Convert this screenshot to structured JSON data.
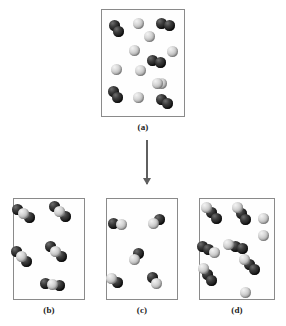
{
  "figure": {
    "type": "particulate-reaction-diagram",
    "atom_colors": {
      "dark": "#191919",
      "light": "#d6d6d6"
    },
    "box_border_color": "#8a8a8a",
    "arrow_color": "#5f5f5f"
  },
  "arrow": {
    "name": "reaction-arrow",
    "direction": "down"
  },
  "panels": [
    {
      "id": "a",
      "caption": "(a)",
      "box": {
        "x": 101,
        "y": 9,
        "w": 84,
        "h": 108
      },
      "contents_summary": {
        "dark_diatomic_molecules": 5,
        "light_single_atoms": 9
      },
      "molecules": [
        {
          "name": "dark-diatomic",
          "x": 9,
          "y": 13,
          "angle": 62,
          "atoms": [
            "dark",
            "dark"
          ]
        },
        {
          "name": "dark-diatomic",
          "x": 58,
          "y": 9,
          "angle": 10,
          "atoms": [
            "dark",
            "dark"
          ]
        },
        {
          "name": "dark-diatomic",
          "x": 49,
          "y": 46,
          "angle": 12,
          "atoms": [
            "dark",
            "dark"
          ]
        },
        {
          "name": "dark-diatomic",
          "x": 8,
          "y": 79,
          "angle": 58,
          "atoms": [
            "dark",
            "dark"
          ]
        },
        {
          "name": "dark-diatomic",
          "x": 57,
          "y": 86,
          "angle": 28,
          "atoms": [
            "dark",
            "dark"
          ]
        }
      ],
      "single_atoms": [
        {
          "name": "light-atom",
          "x": 31,
          "y": 8,
          "type": "light"
        },
        {
          "name": "light-atom",
          "x": 42,
          "y": 21,
          "type": "light"
        },
        {
          "name": "light-atom",
          "x": 27,
          "y": 35,
          "type": "light"
        },
        {
          "name": "light-atom",
          "x": 65,
          "y": 36,
          "type": "light"
        },
        {
          "name": "light-atom",
          "x": 9,
          "y": 54,
          "type": "light"
        },
        {
          "name": "light-atom",
          "x": 33,
          "y": 55,
          "type": "light"
        },
        {
          "name": "light-atom",
          "x": 54,
          "y": 68,
          "type": "light"
        },
        {
          "name": "light-atom",
          "x": 31,
          "y": 82,
          "type": "light"
        },
        {
          "name": "light-atom",
          "x": 50,
          "y": 68,
          "type": "light"
        }
      ]
    },
    {
      "id": "b",
      "caption": "(b)",
      "box": {
        "x": 13,
        "y": 198,
        "w": 72,
        "h": 102
      },
      "contents_summary": {
        "triatomic_molecules": 5,
        "triatomic_composition": "dark-light-dark"
      },
      "molecules": [
        {
          "name": "triatomic-dark-light-dark",
          "x": 4,
          "y": 9,
          "angle": 38,
          "atoms": [
            "dark",
            "light",
            "dark"
          ]
        },
        {
          "name": "triatomic-dark-light-dark",
          "x": 40,
          "y": 7,
          "angle": 40,
          "atoms": [
            "dark",
            "light",
            "dark"
          ]
        },
        {
          "name": "triatomic-dark-light-dark",
          "x": 2,
          "y": 52,
          "angle": 42,
          "atoms": [
            "dark",
            "light",
            "dark"
          ]
        },
        {
          "name": "triatomic-dark-light-dark",
          "x": 36,
          "y": 47,
          "angle": 40,
          "atoms": [
            "dark",
            "light",
            "dark"
          ]
        },
        {
          "name": "triatomic-dark-light-dark",
          "x": 33,
          "y": 80,
          "angle": 10,
          "atoms": [
            "dark",
            "light",
            "dark"
          ]
        }
      ],
      "single_atoms": []
    },
    {
      "id": "c",
      "caption": "(c)",
      "box": {
        "x": 106,
        "y": 198,
        "w": 72,
        "h": 102
      },
      "contents_summary": {
        "diatomic_molecules": 5,
        "diatomic_composition": "dark-light"
      },
      "molecules": [
        {
          "name": "diatomic-dark-light",
          "x": 5,
          "y": 19,
          "angle": 8,
          "atoms": [
            "dark",
            "light"
          ]
        },
        {
          "name": "diatomic-dark-light",
          "x": 44,
          "y": 17,
          "angle": 140,
          "atoms": [
            "dark",
            "light"
          ]
        },
        {
          "name": "diatomic-dark-light",
          "x": 24,
          "y": 52,
          "angle": 118,
          "atoms": [
            "dark",
            "light"
          ]
        },
        {
          "name": "diatomic-dark-light",
          "x": 2,
          "y": 76,
          "angle": 32,
          "atoms": [
            "light",
            "dark"
          ]
        },
        {
          "name": "diatomic-dark-light",
          "x": 42,
          "y": 76,
          "angle": 48,
          "atoms": [
            "dark",
            "light"
          ]
        }
      ],
      "single_atoms": []
    },
    {
      "id": "d",
      "caption": "(d)",
      "box": {
        "x": 199,
        "y": 198,
        "w": 76,
        "h": 102
      },
      "contents_summary": {
        "triatomic_molecules": 6,
        "triatomic_composition": "light-dark-dark",
        "light_single_atoms": 3
      },
      "molecules": [
        {
          "name": "triatomic-light-dark-dark",
          "x": 6,
          "y": 8,
          "angle": 50,
          "atoms": [
            "light",
            "dark",
            "dark"
          ]
        },
        {
          "name": "triatomic-light-dark-dark",
          "x": 36,
          "y": 9,
          "angle": 55,
          "atoms": [
            "light",
            "dark",
            "dark"
          ]
        },
        {
          "name": "triatomic-light-dark-dark",
          "x": 3,
          "y": 45,
          "angle": 28,
          "atoms": [
            "dark",
            "dark",
            "light"
          ]
        },
        {
          "name": "triatomic-light-dark-dark",
          "x": 44,
          "y": 60,
          "angle": 48,
          "atoms": [
            "light",
            "dark",
            "dark"
          ]
        },
        {
          "name": "triatomic-light-dark-dark",
          "x": 2,
          "y": 70,
          "angle": 52,
          "atoms": [
            "light",
            "dark",
            "dark"
          ]
        },
        {
          "name": "triatomic-light-dark-dark",
          "x": 30,
          "y": 42,
          "angle": 18,
          "atoms": [
            "light",
            "dark",
            "dark"
          ]
        }
      ],
      "single_atoms": [
        {
          "name": "light-atom",
          "x": 58,
          "y": 14,
          "type": "light"
        },
        {
          "name": "light-atom",
          "x": 58,
          "y": 31,
          "type": "light"
        },
        {
          "name": "light-atom",
          "x": 40,
          "y": 88,
          "type": "light"
        }
      ]
    }
  ]
}
